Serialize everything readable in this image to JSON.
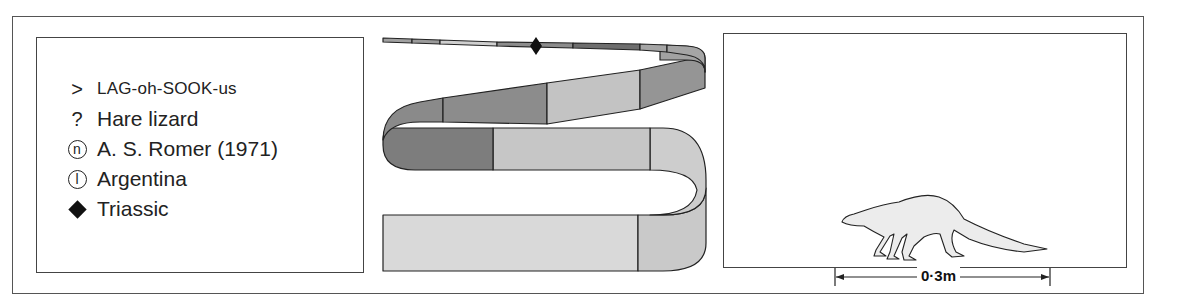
{
  "info": {
    "items": [
      {
        "icon": "pronunciation-icon",
        "symbol": ">",
        "text": "LAG-oh-SOOK-us"
      },
      {
        "icon": "meaning-icon",
        "symbol": "?",
        "text": "Hare lizard"
      },
      {
        "icon": "named-by-icon",
        "symbol": "n",
        "text": "A. S. Romer (1971)"
      },
      {
        "icon": "location-icon",
        "symbol": "l",
        "text": "Argentina"
      },
      {
        "icon": "period-diamond-icon",
        "symbol": "◆",
        "text": "Triassic"
      }
    ]
  },
  "timeline": {
    "marker": "Triassic",
    "colors": {
      "dark": "#7a7a7a",
      "mid": "#9a9a9a",
      "light": "#c4c4c4",
      "pale": "#d8d8d8",
      "stroke": "#222222"
    }
  },
  "scale": {
    "label": "0·3m"
  }
}
